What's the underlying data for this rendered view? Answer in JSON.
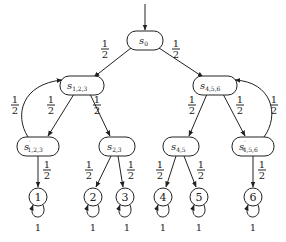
{
  "diagram": {
    "type": "markov-chain-tree",
    "initial_state": "s0",
    "nodes": [
      {
        "id": "s0",
        "base": "s",
        "sub": "0",
        "prime": "",
        "cx": 145,
        "cy": 40,
        "shape": "rounded-rect"
      },
      {
        "id": "s123",
        "base": "s",
        "sub": "1,2,3",
        "prime": "",
        "cx": 82,
        "cy": 85,
        "shape": "rounded-rect"
      },
      {
        "id": "s456",
        "base": "s",
        "sub": "4,5,6",
        "prime": "",
        "cx": 215,
        "cy": 85,
        "shape": "rounded-rect"
      },
      {
        "id": "s123p",
        "base": "s",
        "sub": "1,2,3",
        "prime": "′",
        "cx": 38,
        "cy": 146,
        "shape": "rounded-rect"
      },
      {
        "id": "s23",
        "base": "s",
        "sub": "2,3",
        "prime": "",
        "cx": 117,
        "cy": 146,
        "shape": "rounded-rect"
      },
      {
        "id": "s45",
        "base": "s",
        "sub": "4,5",
        "prime": "",
        "cx": 181,
        "cy": 146,
        "shape": "rounded-rect"
      },
      {
        "id": "s456p",
        "base": "s",
        "sub": "4,5,6",
        "prime": "′",
        "cx": 253,
        "cy": 146,
        "shape": "rounded-rect"
      },
      {
        "id": "d1",
        "label": "1",
        "cx": 38,
        "cy": 197,
        "shape": "circle"
      },
      {
        "id": "d2",
        "label": "2",
        "cx": 93,
        "cy": 197,
        "shape": "circle"
      },
      {
        "id": "d3",
        "label": "3",
        "cx": 125,
        "cy": 197,
        "shape": "circle"
      },
      {
        "id": "d4",
        "label": "4",
        "cx": 163,
        "cy": 197,
        "shape": "circle"
      },
      {
        "id": "d5",
        "label": "5",
        "cx": 199,
        "cy": 197,
        "shape": "circle"
      },
      {
        "id": "d6",
        "label": "6",
        "cx": 253,
        "cy": 197,
        "shape": "circle"
      }
    ],
    "edges": [
      {
        "from": "s0",
        "to": "s123",
        "prob_num": "1",
        "prob_den": "2"
      },
      {
        "from": "s0",
        "to": "s456",
        "prob_num": "1",
        "prob_den": "2"
      },
      {
        "from": "s123",
        "to": "s123p",
        "prob_num": "1",
        "prob_den": "2"
      },
      {
        "from": "s123p",
        "to": "s123",
        "prob_num": "1",
        "prob_den": "2"
      },
      {
        "from": "s123",
        "to": "s23",
        "prob_num": "1",
        "prob_den": "2"
      },
      {
        "from": "s123p",
        "to": "d1",
        "prob_num": "1",
        "prob_den": "2"
      },
      {
        "from": "s23",
        "to": "d2",
        "prob_num": "1",
        "prob_den": "2"
      },
      {
        "from": "s23",
        "to": "d3",
        "prob_num": "1",
        "prob_den": "2"
      },
      {
        "from": "s456",
        "to": "s45",
        "prob_num": "1",
        "prob_den": "2"
      },
      {
        "from": "s456",
        "to": "s456p",
        "prob_num": "1",
        "prob_den": "2"
      },
      {
        "from": "s456p",
        "to": "s456",
        "prob_num": "1",
        "prob_den": "2"
      },
      {
        "from": "s45",
        "to": "d4",
        "prob_num": "1",
        "prob_den": "2"
      },
      {
        "from": "s45",
        "to": "d5",
        "prob_num": "1",
        "prob_den": "2"
      },
      {
        "from": "s456p",
        "to": "d6",
        "prob_num": "1",
        "prob_den": "2"
      },
      {
        "from": "d1",
        "to": "d1",
        "prob": "1"
      },
      {
        "from": "d2",
        "to": "d2",
        "prob": "1"
      },
      {
        "from": "d3",
        "to": "d3",
        "prob": "1"
      },
      {
        "from": "d4",
        "to": "d4",
        "prob": "1"
      },
      {
        "from": "d5",
        "to": "d5",
        "prob": "1"
      },
      {
        "from": "d6",
        "to": "d6",
        "prob": "1"
      }
    ],
    "labels": {
      "half_num": "1",
      "half_den": "2",
      "one": "1",
      "s": "s",
      "prime": "′",
      "sub_0": "0",
      "sub_123": "1,2,3",
      "sub_456": "4,5,6",
      "sub_23": "2,3",
      "sub_45": "4,5",
      "leaf_1": "1",
      "leaf_2": "2",
      "leaf_3": "3",
      "leaf_4": "4",
      "leaf_5": "5",
      "leaf_6": "6"
    }
  }
}
